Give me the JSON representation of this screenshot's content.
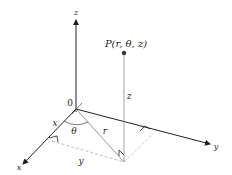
{
  "diagram": {
    "point_label": "P(r, θ, z)",
    "axis_labels": {
      "x": "x",
      "y": "y",
      "z": "z"
    },
    "origin_label": "0",
    "segment_labels": {
      "x": "x",
      "y": "y",
      "r": "r",
      "z": "z",
      "theta": "θ"
    },
    "colors": {
      "axis": "#231f20",
      "guide": "#9a9a9a",
      "dashed": "#b5b5b5",
      "point": "#3a3a3a",
      "text": "#231f20"
    }
  }
}
